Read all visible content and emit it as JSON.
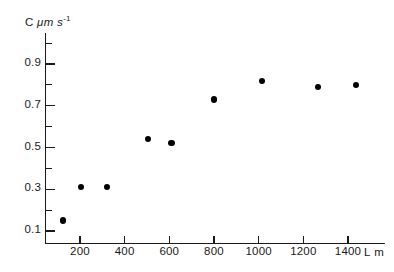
{
  "chart_data": {
    "type": "scatter",
    "title": "",
    "ylabel": "C μm s⁻¹",
    "xlabel": "L m",
    "xlim": [
      0,
      1520
    ],
    "ylim": [
      0.0,
      1.0
    ],
    "grid": false,
    "legend": null,
    "x": [
      125,
      205,
      320,
      505,
      610,
      800,
      1015,
      1265,
      1435
    ],
    "y": [
      0.15,
      0.31,
      0.31,
      0.54,
      0.52,
      0.73,
      0.82,
      0.79,
      0.8
    ],
    "points": [
      {
        "x": 125,
        "y": 0.15
      },
      {
        "x": 205,
        "y": 0.31
      },
      {
        "x": 320,
        "y": 0.31
      },
      {
        "x": 505,
        "y": 0.54
      },
      {
        "x": 610,
        "y": 0.52
      },
      {
        "x": 800,
        "y": 0.73
      },
      {
        "x": 1015,
        "y": 0.82
      },
      {
        "x": 1265,
        "y": 0.79
      },
      {
        "x": 1435,
        "y": 0.8
      }
    ],
    "yticks_major": [
      0.1,
      0.3,
      0.5,
      0.7,
      0.9
    ],
    "yticks_major_labels": [
      "0.1",
      "0.3",
      "0.5",
      "0.7",
      "0.9"
    ],
    "yticks_minor": [
      0.2,
      0.4,
      0.6,
      0.8,
      1.0
    ],
    "xticks": [
      200,
      400,
      600,
      800,
      1000,
      1200,
      1400
    ],
    "xticks_labels": [
      "200",
      "400",
      "600",
      "800",
      "1000",
      "1200",
      "1400"
    ],
    "marker": "filled-circle",
    "marker_color": "#000000",
    "axis_color": "#1a1a1a",
    "background_color": "#ffffff"
  },
  "axis_titles": {
    "y_prefix": "C",
    "y_unit_mu": "μm s",
    "y_exponent": "-1",
    "x": "L m"
  }
}
